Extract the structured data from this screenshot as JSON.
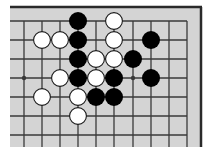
{
  "diagram": {
    "type": "go-board-fragment",
    "colors": {
      "board": "#d4d4d4",
      "line": "#3a3a3a",
      "border": "#2a2a2a",
      "black_stone": "#000000",
      "white_stone": "#ffffff",
      "white_stone_outline": "#1a1a1a",
      "background": "#ffffff"
    },
    "grid": {
      "columns_x": [
        24,
        42,
        60,
        78,
        96,
        114,
        133,
        151,
        169,
        187
      ],
      "rows_y": [
        21,
        40,
        59,
        78,
        97,
        116,
        135
      ],
      "top_edge": true,
      "right_edge": true
    },
    "star_points": [
      {
        "col": 0,
        "row": 3
      },
      {
        "col": 6,
        "row": 3
      }
    ],
    "stones": [
      {
        "color": "black",
        "col": 3,
        "row": 0
      },
      {
        "color": "white",
        "col": 5,
        "row": 0
      },
      {
        "color": "white",
        "col": 1,
        "row": 1
      },
      {
        "color": "white",
        "col": 2,
        "row": 1
      },
      {
        "color": "black",
        "col": 3,
        "row": 1
      },
      {
        "color": "white",
        "col": 5,
        "row": 1
      },
      {
        "color": "black",
        "col": 7,
        "row": 1
      },
      {
        "color": "black",
        "col": 3,
        "row": 2
      },
      {
        "color": "white",
        "col": 4,
        "row": 2
      },
      {
        "color": "white",
        "col": 5,
        "row": 2
      },
      {
        "color": "black",
        "col": 6,
        "row": 2
      },
      {
        "color": "white",
        "col": 2,
        "row": 3
      },
      {
        "color": "black",
        "col": 3,
        "row": 3
      },
      {
        "color": "white",
        "col": 4,
        "row": 3
      },
      {
        "color": "black",
        "col": 5,
        "row": 3
      },
      {
        "color": "black",
        "col": 7,
        "row": 3
      },
      {
        "color": "white",
        "col": 1,
        "row": 4
      },
      {
        "color": "white",
        "col": 3,
        "row": 4
      },
      {
        "color": "black",
        "col": 4,
        "row": 4
      },
      {
        "color": "black",
        "col": 5,
        "row": 4
      },
      {
        "color": "white",
        "col": 3,
        "row": 5
      }
    ]
  }
}
